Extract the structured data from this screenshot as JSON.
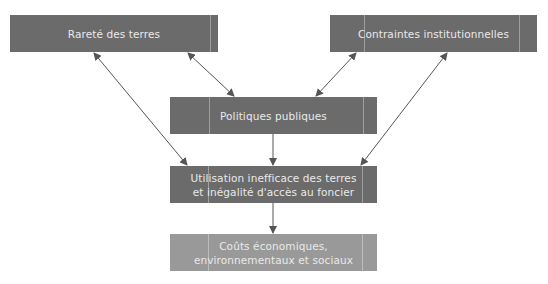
{
  "diagram": {
    "colors": {
      "box_dark": "#6b6b6b",
      "box_light": "#999999",
      "arrow": "#555555",
      "text": "#e9e9e9"
    },
    "nodes": {
      "rarete": {
        "label": "Rareté des terres"
      },
      "contraintes": {
        "label": "Contraintes institutionnelles"
      },
      "politiques": {
        "label": "Politiques publiques"
      },
      "utilisation": {
        "label": "Utilisation inefficace des terres et inégalité d'accès au foncier"
      },
      "couts": {
        "label": "Coûts économiques, environnementaux et sociaux"
      }
    },
    "edges": [
      {
        "from": "rarete",
        "to": "politiques",
        "type": "bidirectional"
      },
      {
        "from": "contraintes",
        "to": "politiques",
        "type": "bidirectional"
      },
      {
        "from": "rarete",
        "to": "utilisation",
        "type": "bidirectional"
      },
      {
        "from": "contraintes",
        "to": "utilisation",
        "type": "bidirectional"
      },
      {
        "from": "politiques",
        "to": "utilisation",
        "type": "directed"
      },
      {
        "from": "utilisation",
        "to": "couts",
        "type": "directed"
      }
    ]
  }
}
